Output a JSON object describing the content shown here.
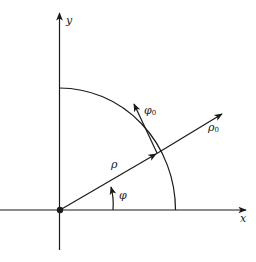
{
  "diagram": {
    "type": "polar coordinate system with unit vectors",
    "labels": {
      "x_axis": "x",
      "y_axis": "y",
      "rho": "ρ",
      "phi": "φ",
      "rho0_symbol": "ρ",
      "rho0_subscript": "0",
      "phi0_symbol": "φ",
      "phi0_subscript": "0"
    },
    "colors": {
      "stroke": "#1a1a1a",
      "background": "#ffffff"
    }
  }
}
